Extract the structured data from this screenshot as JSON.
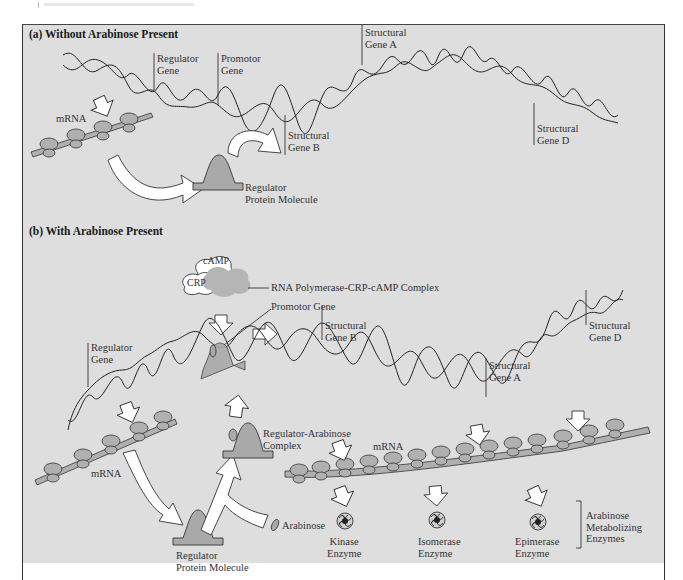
{
  "figure": {
    "part_a": {
      "title": "(a)  Without Arabinose Present",
      "labels": {
        "regulator_gene": [
          "Regulator",
          "Gene"
        ],
        "promotor_gene": [
          "Promotor",
          "Gene"
        ],
        "structural_gene_a": [
          "Structural",
          "Gene A"
        ],
        "structural_gene_b": [
          "Structural",
          "Gene B"
        ],
        "structural_gene_d": [
          "Structural",
          "Gene D"
        ],
        "mrna": "mRNA",
        "regulator_protein": [
          "Regulator",
          "Protein Molecule"
        ]
      }
    },
    "part_b": {
      "title": "(b)  With Arabinose Present",
      "labels": {
        "camp": "cAMP",
        "crp": "CRP",
        "complex": "RNA Polymerase-CRP-cAMP Complex",
        "promotor_gene": "Promotor  Gene",
        "regulator_gene": [
          "Regulator",
          "Gene"
        ],
        "structural_gene_b": [
          "Structural",
          "Gene B"
        ],
        "structural_gene_a": [
          "Structural",
          "Gene A"
        ],
        "structural_gene_d": [
          "Structural",
          "Gene D"
        ],
        "regulator_arabinose_complex": [
          "Regulator-Arabinose",
          "Complex"
        ],
        "mrna_left": "mRNA",
        "mrna_right": "mRNA",
        "arabinose": "Arabinose",
        "regulator_protein": [
          "Regulator",
          "Protein Molecule"
        ],
        "kinase": [
          "Kinase",
          "Enzyme"
        ],
        "isomerase": [
          "Isomerase",
          "Enzyme"
        ],
        "epimerase": [
          "Epimerase",
          "Enzyme"
        ],
        "enzymes_group": [
          "Arabinose",
          "Metabolizing",
          "Enzymes"
        ]
      }
    },
    "colors": {
      "panel_bg": "#dedede",
      "protein_fill": "#a9a9a9",
      "ribosome_fill": "#b0b0b0",
      "complex_cloud": "#b5b5b5",
      "arrow_fill": "#ffffff",
      "line": "#222222"
    }
  }
}
